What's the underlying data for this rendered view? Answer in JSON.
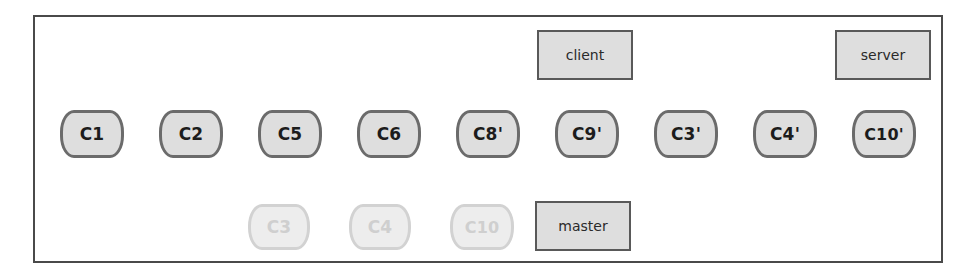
{
  "diagram": {
    "frame": {
      "border_color": "#4a4a4a"
    },
    "colors": {
      "active_fill": "#dedede",
      "active_border": "#6b6b6b",
      "active_text": "#1c1c1c",
      "faded_fill": "#ededed",
      "faded_border": "#d2d2d2",
      "faded_text": "#cfcfcf",
      "label_fill": "#dedede",
      "label_border": "#595959",
      "arrow_dark": "#1c1c1c",
      "arrow_light": "#c4c4c4"
    },
    "main_chain": {
      "name": "rewritten-commit-chain",
      "direction": "right-to-left",
      "nodes": [
        {
          "id": "c1",
          "label": "C1",
          "x": 60,
          "y": 110,
          "w": 64,
          "h": 48
        },
        {
          "id": "c2",
          "label": "C2",
          "x": 159,
          "y": 110,
          "w": 64,
          "h": 48
        },
        {
          "id": "c5",
          "label": "C5",
          "x": 258,
          "y": 110,
          "w": 64,
          "h": 48
        },
        {
          "id": "c6",
          "label": "C6",
          "x": 357,
          "y": 110,
          "w": 64,
          "h": 48
        },
        {
          "id": "c8p",
          "label": "C8'",
          "x": 456,
          "y": 110,
          "w": 64,
          "h": 48
        },
        {
          "id": "c9p",
          "label": "C9'",
          "x": 555,
          "y": 110,
          "w": 64,
          "h": 48
        },
        {
          "id": "c3p",
          "label": "C3'",
          "x": 654,
          "y": 110,
          "w": 64,
          "h": 48
        },
        {
          "id": "c4p",
          "label": "C4'",
          "x": 753,
          "y": 110,
          "w": 64,
          "h": 48
        },
        {
          "id": "c10p",
          "label": "C10'",
          "x": 852,
          "y": 110,
          "w": 64,
          "h": 48
        }
      ]
    },
    "faded_chain": {
      "name": "abandoned-commit-chain",
      "direction": "right-to-left",
      "nodes": [
        {
          "id": "c3",
          "label": "C3",
          "x": 248,
          "y": 204,
          "w": 62,
          "h": 46
        },
        {
          "id": "c4",
          "label": "C4",
          "x": 349,
          "y": 204,
          "w": 62,
          "h": 46
        },
        {
          "id": "c10",
          "label": "C10",
          "x": 450,
          "y": 204,
          "w": 64,
          "h": 46
        }
      ]
    },
    "labels": [
      {
        "id": "client",
        "label": "client",
        "x": 537,
        "y": 30,
        "w": 96,
        "h": 50
      },
      {
        "id": "server",
        "label": "server",
        "x": 835,
        "y": 30,
        "w": 96,
        "h": 50
      },
      {
        "id": "master",
        "label": "master",
        "x": 535,
        "y": 201,
        "w": 96,
        "h": 50
      }
    ],
    "edges": [
      {
        "from": "c2",
        "to": "c1",
        "style": "dark"
      },
      {
        "from": "c5",
        "to": "c2",
        "style": "dark"
      },
      {
        "from": "c6",
        "to": "c5",
        "style": "dark"
      },
      {
        "from": "c8p",
        "to": "c6",
        "style": "dark"
      },
      {
        "from": "c9p",
        "to": "c8p",
        "style": "dark"
      },
      {
        "from": "c3p",
        "to": "c9p",
        "style": "dark"
      },
      {
        "from": "c4p",
        "to": "c3p",
        "style": "dark"
      },
      {
        "from": "c10p",
        "to": "c4p",
        "style": "dark"
      },
      {
        "from": "c4",
        "to": "c3",
        "style": "light"
      },
      {
        "from": "c10",
        "to": "c4",
        "style": "light"
      },
      {
        "from": "c3",
        "to": "c2",
        "style": "light-diagonal"
      },
      {
        "from": "client",
        "to": "c9p",
        "style": "dark-vertical"
      },
      {
        "from": "server",
        "to": "c10p",
        "style": "dark-vertical"
      },
      {
        "from": "master",
        "to": "c9p",
        "style": "dark-vertical-up"
      }
    ]
  }
}
